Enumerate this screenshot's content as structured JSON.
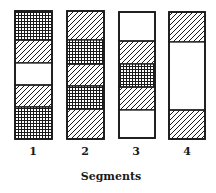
{
  "figure": {
    "title": "Segments",
    "legend_patterns": {
      "crosshatch": "dense grid hatching",
      "diagonal": "diagonal line hatching",
      "blank": "unfilled"
    },
    "segments": [
      {
        "label": "1",
        "x": 15,
        "width": 37,
        "top": 11,
        "bottom": 139,
        "bands": [
          {
            "pattern": "crosshatch",
            "y0": 11,
            "y1": 40
          },
          {
            "pattern": "diagonal",
            "y0": 40,
            "y1": 63
          },
          {
            "pattern": "blank",
            "y0": 63,
            "y1": 85
          },
          {
            "pattern": "diagonal",
            "y0": 85,
            "y1": 107
          },
          {
            "pattern": "crosshatch",
            "y0": 107,
            "y1": 139
          }
        ]
      },
      {
        "label": "2",
        "x": 67,
        "width": 37,
        "top": 11,
        "bottom": 139,
        "bands": [
          {
            "pattern": "diagonal",
            "y0": 11,
            "y1": 40
          },
          {
            "pattern": "crosshatch",
            "y0": 40,
            "y1": 64
          },
          {
            "pattern": "diagonal",
            "y0": 64,
            "y1": 86
          },
          {
            "pattern": "crosshatch",
            "y0": 86,
            "y1": 109
          },
          {
            "pattern": "diagonal",
            "y0": 109,
            "y1": 139
          }
        ]
      },
      {
        "label": "3",
        "x": 119,
        "width": 36,
        "top": 12,
        "bottom": 138,
        "bands": [
          {
            "pattern": "blank",
            "y0": 12,
            "y1": 41
          },
          {
            "pattern": "diagonal",
            "y0": 41,
            "y1": 64
          },
          {
            "pattern": "crosshatch",
            "y0": 64,
            "y1": 87
          },
          {
            "pattern": "diagonal",
            "y0": 87,
            "y1": 110
          },
          {
            "pattern": "blank",
            "y0": 110,
            "y1": 138
          }
        ]
      },
      {
        "label": "4",
        "x": 169,
        "width": 36,
        "top": 12,
        "bottom": 139,
        "bands": [
          {
            "pattern": "diagonal",
            "y0": 12,
            "y1": 42
          },
          {
            "pattern": "blank",
            "y0": 42,
            "y1": 110
          },
          {
            "pattern": "diagonal",
            "y0": 110,
            "y1": 139
          }
        ]
      }
    ],
    "colors": {
      "ink": "#1a1a1a",
      "background": "#ffffff"
    }
  }
}
